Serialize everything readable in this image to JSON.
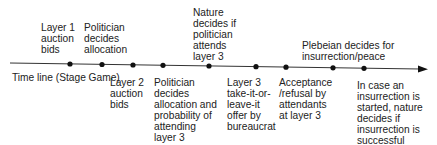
{
  "timeline": {
    "axis_label": "Time line (Stage Game)",
    "events_above": [
      {
        "text": "Layer 1\nauction\nbids"
      },
      {
        "text": "Politician\ndecides\nallocation"
      },
      {
        "text": "Nature\ndecides if\npolitician\nattends\nlayer 3"
      },
      {
        "text": "Plebeian decides for\ninsurrection/peace"
      }
    ],
    "events_below": [
      {
        "text": "Layer 2\nauction\nbids"
      },
      {
        "text": "Politician\ndecides\nallocation and\nprobability of\nattending\nlayer 3"
      },
      {
        "text": "Layer 3\ntake-it-or-\nleave-it\noffer by\nbureaucrat"
      },
      {
        "text": "Acceptance\n/refusal by\nattendants\nat layer 3"
      },
      {
        "text": "In case an\ninsurrection is\nstarted, nature\ndecides if\ninsurrection is\nsuccessful"
      }
    ],
    "dot_count": 9
  }
}
